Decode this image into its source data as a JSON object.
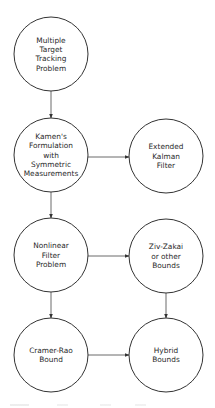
{
  "diagram": {
    "colors": {
      "background": "#ffffff",
      "node_stroke": "#333333",
      "edge_stroke": "#444444",
      "text": "#2a2a2a"
    },
    "nodes": [
      {
        "id": "mtt",
        "lines": [
          "Multiple",
          "Target",
          "Tracking",
          "Problem"
        ],
        "cx": 51,
        "cy": 54,
        "r": 37
      },
      {
        "id": "kamen",
        "lines": [
          "Kamen's",
          "Formulation",
          "with",
          "Symmetric",
          "Measurements"
        ],
        "cx": 51,
        "cy": 155,
        "r": 37
      },
      {
        "id": "ekf",
        "lines": [
          "Extended",
          "Kalman",
          "Filter"
        ],
        "cx": 166,
        "cy": 156,
        "r": 37
      },
      {
        "id": "nonlinear",
        "lines": [
          "Nonlinear",
          "Filter",
          "Problem"
        ],
        "cx": 51,
        "cy": 255,
        "r": 37
      },
      {
        "id": "zivzakai",
        "lines": [
          "Ziv-Zakai",
          "or other",
          "Bounds"
        ],
        "cx": 166,
        "cy": 256,
        "r": 37
      },
      {
        "id": "crb",
        "lines": [
          "Cramer-Rao",
          "Bound"
        ],
        "cx": 51,
        "cy": 355,
        "r": 37
      },
      {
        "id": "hybrid",
        "lines": [
          "Hybrid",
          "Bounds"
        ],
        "cx": 166,
        "cy": 355,
        "r": 37
      }
    ],
    "edges": [
      {
        "from": "mtt",
        "to": "kamen",
        "x1": 51,
        "y1": 91,
        "x2": 51,
        "y2": 118
      },
      {
        "from": "kamen",
        "to": "ekf",
        "x1": 88,
        "y1": 157,
        "x2": 129,
        "y2": 157
      },
      {
        "from": "kamen",
        "to": "nonlinear",
        "x1": 51,
        "y1": 192,
        "x2": 51,
        "y2": 218
      },
      {
        "from": "nonlinear",
        "to": "zivzakai",
        "x1": 88,
        "y1": 256,
        "x2": 129,
        "y2": 256
      },
      {
        "from": "zivzakai",
        "to": "hybrid",
        "x1": 166,
        "y1": 293,
        "x2": 166,
        "y2": 318
      },
      {
        "from": "nonlinear",
        "to": "crb",
        "x1": 51,
        "y1": 292,
        "x2": 51,
        "y2": 318
      },
      {
        "from": "crb",
        "to": "hybrid",
        "x1": 88,
        "y1": 355,
        "x2": 129,
        "y2": 355
      }
    ]
  }
}
